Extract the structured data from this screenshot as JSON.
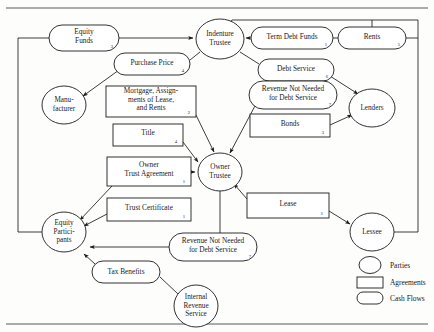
{
  "diagram": {
    "parties": [
      {
        "id": "indenture-trustee",
        "label_lines": [
          "Indenture",
          "Trustee"
        ],
        "cx": 220,
        "cy": 39,
        "rx": 24,
        "ry": 20
      },
      {
        "id": "manufacturer",
        "label_lines": [
          "Manu-",
          "facturer"
        ],
        "cx": 64,
        "cy": 105,
        "rx": 22,
        "ry": 19
      },
      {
        "id": "lenders",
        "label_lines": [
          "Lenders"
        ],
        "cx": 372,
        "cy": 108,
        "rx": 23,
        "ry": 19
      },
      {
        "id": "owner-trustee",
        "label_lines": [
          "Owner",
          "Trustee"
        ],
        "cx": 220,
        "cy": 172,
        "rx": 22,
        "ry": 19
      },
      {
        "id": "equity-participants",
        "label_lines": [
          "Equity",
          "Partici-",
          "pants"
        ],
        "cx": 64,
        "cy": 232,
        "rx": 22,
        "ry": 20
      },
      {
        "id": "lessee",
        "label_lines": [
          "Lessee"
        ],
        "cx": 372,
        "cy": 232,
        "rx": 22,
        "ry": 19
      },
      {
        "id": "internal-revenue-service",
        "label_lines": [
          "Internal",
          "Revenue",
          "Service"
        ],
        "cx": 196,
        "cy": 306,
        "rx": 22,
        "ry": 21
      }
    ],
    "cash_flows": [
      {
        "id": "equity-funds",
        "label_lines": [
          "Equity",
          "Funds"
        ],
        "number": "3",
        "cx": 84,
        "cy": 38,
        "rx": 35,
        "ry": 13
      },
      {
        "id": "term-debt-funds",
        "label_lines": [
          "Term Debt Funds"
        ],
        "number": "1",
        "cx": 292,
        "cy": 38,
        "rx": 41,
        "ry": 11
      },
      {
        "id": "rents",
        "label_lines": [
          "Rents"
        ],
        "number": "5",
        "cx": 372,
        "cy": 38,
        "rx": 34,
        "ry": 11
      },
      {
        "id": "purchase-price",
        "label_lines": [
          "Purchase Price"
        ],
        "number": "4",
        "cx": 152,
        "cy": 64,
        "rx": 38,
        "ry": 11
      },
      {
        "id": "debt-service",
        "label_lines": [
          "Debt Service"
        ],
        "number": "6",
        "cx": 296,
        "cy": 70,
        "rx": 38,
        "ry": 11
      },
      {
        "id": "revenue-not-needed-top",
        "label_lines": [
          "Revenue Not Needed",
          "for Debt Service"
        ],
        "number": "7",
        "cx": 293,
        "cy": 95,
        "rx": 44,
        "ry": 14
      },
      {
        "id": "revenue-not-needed-bottom",
        "label_lines": [
          "Revenue Not Needed",
          "for Debt Service"
        ],
        "number": "7",
        "cx": 213,
        "cy": 247,
        "rx": 44,
        "ry": 14
      },
      {
        "id": "tax-benefits",
        "label_lines": [
          "Tax Benefits"
        ],
        "number": "",
        "cx": 126,
        "cy": 272,
        "rx": 34,
        "ry": 11
      }
    ],
    "agreements": [
      {
        "id": "mortgage-assignments",
        "label_lines": [
          "Mortgage, Assign-",
          "ments of Lease,",
          "and Rents"
        ],
        "number": "2",
        "x": 106,
        "y": 86,
        "w": 90,
        "h": 31,
        "align": "center"
      },
      {
        "id": "title",
        "label_lines": [
          "Title"
        ],
        "number": "4",
        "x": 113,
        "y": 124,
        "w": 70,
        "h": 22
      },
      {
        "id": "bonds",
        "label_lines": [
          "Bonds"
        ],
        "number": "3",
        "x": 250,
        "y": 114,
        "w": 80,
        "h": 23
      },
      {
        "id": "owner-trust-agreement",
        "label_lines": [
          "Owner",
          "Trust Agreement"
        ],
        "number": "1",
        "x": 107,
        "y": 157,
        "w": 84,
        "h": 29
      },
      {
        "id": "trust-certificate",
        "label_lines": [
          "Trust Certificate"
        ],
        "number": "1",
        "x": 107,
        "y": 198,
        "w": 84,
        "h": 23
      },
      {
        "id": "lease",
        "label_lines": [
          "Lease"
        ],
        "number": "1",
        "x": 247,
        "y": 193,
        "w": 82,
        "h": 25
      }
    ],
    "legend": {
      "items": [
        {
          "id": "legend-parties",
          "shape": "circle",
          "label": "Parties"
        },
        {
          "id": "legend-agreements",
          "shape": "rectangle",
          "label": "Agreements"
        },
        {
          "id": "legend-cash-flows",
          "shape": "ellipse",
          "label": "Cash Flows"
        }
      ]
    }
  }
}
